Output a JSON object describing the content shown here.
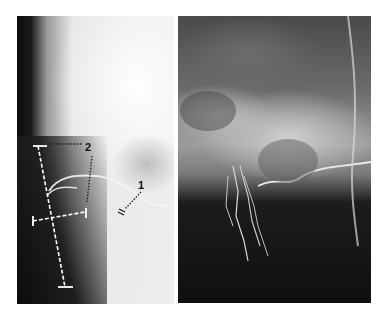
{
  "figure": {
    "panels": [
      {
        "id": "left",
        "description": "lateral radiograph (angiogram) with measurement overlay",
        "labels": [
          {
            "text": "2",
            "x": 88,
            "y": 148
          },
          {
            "text": "1",
            "x": 141,
            "y": 186
          }
        ]
      },
      {
        "id": "right",
        "description": "lateral skull radiograph showing contrast-filled vessels"
      }
    ]
  }
}
